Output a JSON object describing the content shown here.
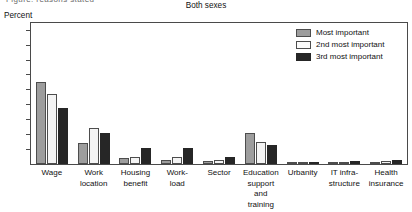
{
  "cut_text": "Figure: reasons stated",
  "header": {
    "title": "Both sexes",
    "axis_unit": "Percent"
  },
  "legend": {
    "position": "top-right",
    "items": [
      {
        "label": "Most important",
        "color": "#9d9d9d",
        "key": "swatch-most-important"
      },
      {
        "label": "2nd most important",
        "color": "#fbfbfb",
        "key": "swatch-2nd-most-important"
      },
      {
        "label": "3rd most important",
        "color": "#262626",
        "key": "swatch-3rd-most-important"
      }
    ]
  },
  "chart_data": {
    "type": "bar",
    "title": "Both sexes",
    "xlabel": "",
    "ylabel": "Percent",
    "ylim": [
      0,
      95
    ],
    "yticks": [
      10,
      20,
      30,
      40,
      50,
      60,
      70,
      80,
      90
    ],
    "grid": false,
    "legend_position": "top-right",
    "categories": [
      "Wage",
      "Work\nlocation",
      "Housing\nbenefit",
      "Work-\nload",
      "Sector",
      "Education\nsupport\nand training",
      "Urbanity",
      "IT infra-\nstructure",
      "Health\ninsurance"
    ],
    "series": [
      {
        "name": "Most important",
        "color": "#9d9d9d",
        "values": [
          55,
          14,
          4,
          3,
          2,
          21,
          1,
          1,
          1
        ]
      },
      {
        "name": "2nd most important",
        "color": "#fbfbfb",
        "values": [
          47,
          24,
          5,
          5,
          3,
          15,
          1,
          1,
          2
        ]
      },
      {
        "name": "3rd most important",
        "color": "#262626",
        "values": [
          38,
          21,
          11,
          11,
          5,
          13,
          1,
          2,
          3
        ]
      }
    ]
  }
}
